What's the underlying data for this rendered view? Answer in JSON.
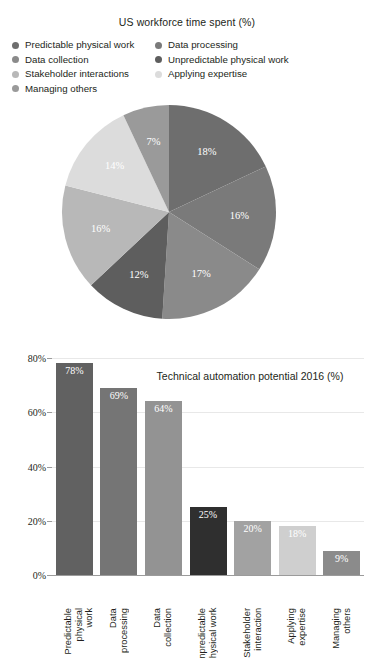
{
  "pie_panel": {
    "title": "US workforce time spent (%)",
    "legend": {
      "left": [
        {
          "label": "Predictable physical work",
          "color": "#6e6e6e"
        },
        {
          "label": "Data collection",
          "color": "#8a8a8a"
        },
        {
          "label": "Stakeholder interactions",
          "color": "#b8b8b8"
        },
        {
          "label": "Managing others",
          "color": "#9a9a9a"
        }
      ],
      "right": [
        {
          "label": "Data processing",
          "color": "#7a7a7a"
        },
        {
          "label": "Unpredictable physical work",
          "color": "#5e5e5e"
        },
        {
          "label": "Applying expertise",
          "color": "#dcdcdc"
        }
      ]
    }
  },
  "chart_data": [
    {
      "type": "pie",
      "title": "US workforce time spent (%)",
      "legend_position": "top",
      "unit": "%",
      "start_angle_deg": 0,
      "direction": "clockwise",
      "categories": [
        "Predictable physical work",
        "Data processing",
        "Data collection",
        "Unpredictable physical work",
        "Stakeholder interactions",
        "Applying expertise",
        "Managing others"
      ],
      "values": [
        18,
        16,
        17,
        12,
        16,
        14,
        7
      ],
      "labels": [
        "18%",
        "16%",
        "17%",
        "12%",
        "16%",
        "14%",
        "7%"
      ],
      "colors": [
        "#6e6e6e",
        "#7a7a7a",
        "#8a8a8a",
        "#5e5e5e",
        "#b8b8b8",
        "#dcdcdc",
        "#9a9a9a"
      ]
    },
    {
      "type": "bar",
      "title": "Technical automation potential 2016 (%)",
      "xlabel": "",
      "ylabel": "",
      "ylim": [
        0,
        80
      ],
      "yticks": [
        0,
        20,
        40,
        60,
        80
      ],
      "ytick_labels": [
        "0%",
        "20%",
        "40%",
        "60%",
        "80%"
      ],
      "grid": true,
      "categories": [
        "Predictable\nphysical work",
        "Data\nprocessing",
        "Data\ncollection",
        "Unpredictable\nphysical work",
        "Stakeholder\ninteraction",
        "Applying\nexpertise",
        "Managing\nothers"
      ],
      "values": [
        78,
        69,
        64,
        25,
        20,
        18,
        9
      ],
      "labels": [
        "78%",
        "69%",
        "64%",
        "25%",
        "20%",
        "18%",
        "9%"
      ],
      "colors": [
        "#616161",
        "#757575",
        "#939393",
        "#2f2f2f",
        "#a2a2a2",
        "#cfcfcf",
        "#8b8b8b"
      ]
    }
  ]
}
